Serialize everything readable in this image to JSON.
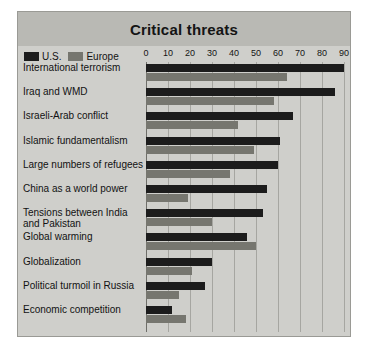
{
  "chart_data": {
    "type": "bar",
    "orientation": "horizontal",
    "title": "Critical threats",
    "xlabel": "",
    "ylabel": "",
    "xlim": [
      0,
      90
    ],
    "grid": true,
    "legend_position": "top-left",
    "tick_labels": [
      "0",
      "10",
      "20",
      "30",
      "40",
      "50",
      "60",
      "70",
      "80",
      "90"
    ],
    "tick_values": [
      0,
      10,
      20,
      30,
      40,
      50,
      60,
      70,
      80,
      90
    ],
    "categories": [
      "International terrorism",
      "Iraq and WMD",
      "Israeli-Arab conflict",
      "Islamic fundamentalism",
      "Large numbers of refugees",
      "China as a world power",
      "Tensions between India and Pakistan",
      "Global warming",
      "Globalization",
      "Political turmoil in Russia",
      "Economic competition"
    ],
    "series": [
      {
        "name": "U.S.",
        "color": "#1c1c1c",
        "values": [
          90,
          86,
          67,
          61,
          60,
          55,
          53,
          46,
          30,
          27,
          12
        ]
      },
      {
        "name": "Europe",
        "color": "#76766f",
        "values": [
          64,
          58,
          42,
          49,
          38,
          19,
          30,
          50,
          21,
          15,
          18
        ]
      }
    ]
  }
}
